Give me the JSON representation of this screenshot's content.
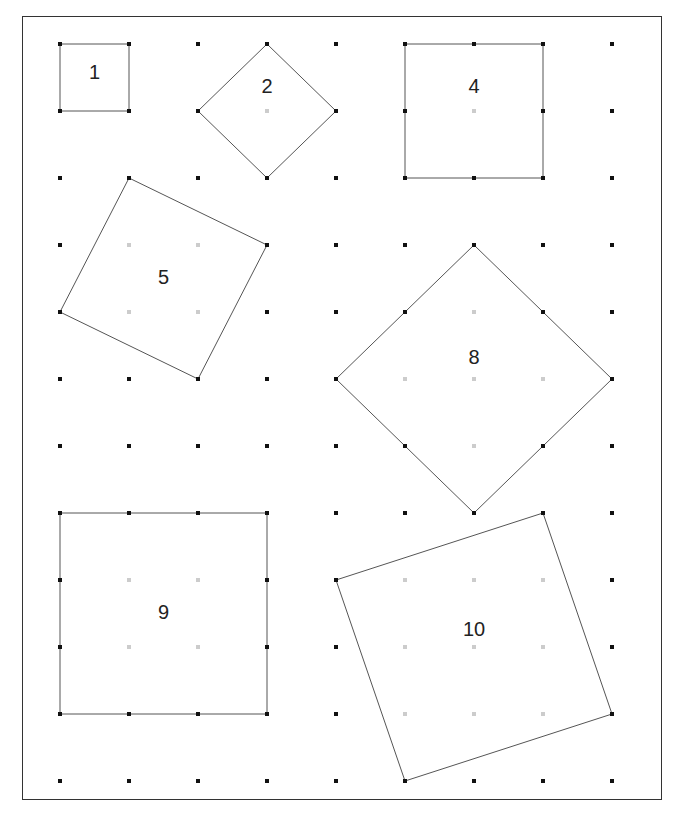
{
  "grid": {
    "cols": 9,
    "rows": 12,
    "origin_x": 60,
    "origin_y": 44,
    "step_x": 69,
    "step_y": 67,
    "dot_color": "#111111",
    "interior_dot_color": "#cccccc"
  },
  "squares": [
    {
      "label": "1",
      "vertices": [
        [
          0,
          0
        ],
        [
          1,
          0
        ],
        [
          1,
          1
        ],
        [
          0,
          1
        ]
      ],
      "label_pos": [
        0.5,
        0.45
      ]
    },
    {
      "label": "2",
      "vertices": [
        [
          3,
          0
        ],
        [
          4,
          1
        ],
        [
          3,
          2
        ],
        [
          2,
          1
        ]
      ],
      "label_pos": [
        3,
        0.65
      ]
    },
    {
      "label": "4",
      "vertices": [
        [
          5,
          0
        ],
        [
          7,
          0
        ],
        [
          7,
          2
        ],
        [
          5,
          2
        ]
      ],
      "label_pos": [
        6,
        0.65
      ]
    },
    {
      "label": "5",
      "vertices": [
        [
          1,
          2
        ],
        [
          3,
          3
        ],
        [
          2,
          5
        ],
        [
          0,
          4
        ]
      ],
      "label_pos": [
        1.5,
        3.5
      ]
    },
    {
      "label": "8",
      "vertices": [
        [
          6,
          3
        ],
        [
          8,
          5
        ],
        [
          6,
          7
        ],
        [
          4,
          5
        ]
      ],
      "label_pos": [
        6,
        4.7
      ]
    },
    {
      "label": "9",
      "vertices": [
        [
          0,
          7
        ],
        [
          3,
          7
        ],
        [
          3,
          10
        ],
        [
          0,
          10
        ]
      ],
      "label_pos": [
        1.5,
        8.5
      ]
    },
    {
      "label": "10",
      "vertices": [
        [
          7,
          7
        ],
        [
          8,
          10
        ],
        [
          5,
          11
        ],
        [
          4,
          8
        ]
      ],
      "label_pos": [
        6,
        8.75
      ]
    }
  ]
}
